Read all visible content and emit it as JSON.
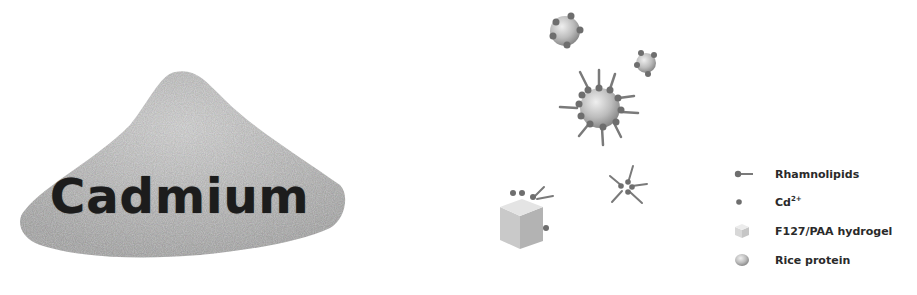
{
  "left_panel": {
    "label": "Cadmium",
    "image": "powder-pile"
  },
  "diagram": {
    "elements": [
      "rice-protein-particle-with-cd",
      "rice-protein-particle-small-with-cd",
      "rice-protein-micelle-with-rhamnolipids",
      "rhamnolipid-cd-complex",
      "hydrogel-cube-with-cd-and-rhamnolipid"
    ]
  },
  "legend": {
    "items": [
      {
        "icon": "rhamnolipid-icon",
        "label": "Rhamnolipids"
      },
      {
        "icon": "cd-ion-icon",
        "label": "Cd",
        "superscript": "2+"
      },
      {
        "icon": "hydrogel-cube-icon",
        "label": "F127/PAA hydrogel"
      },
      {
        "icon": "rice-protein-icon",
        "label": "Rice protein"
      }
    ]
  },
  "colors": {
    "powder": "#b9b9b9",
    "particle": "#bdbdbd",
    "dot": "#6e6e6e",
    "text": "#2a2a2a"
  }
}
